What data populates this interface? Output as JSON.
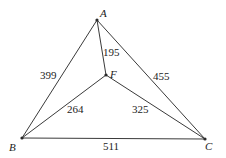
{
  "diagram": {
    "type": "weighted-graph",
    "vertices": [
      {
        "id": "A",
        "label": "A",
        "x": 97,
        "y": 20,
        "lx": 100,
        "ly": 17
      },
      {
        "id": "F",
        "label": "F",
        "x": 106,
        "y": 75,
        "lx": 110,
        "ly": 78
      },
      {
        "id": "B",
        "label": "B",
        "x": 22,
        "y": 138,
        "lx": 9,
        "ly": 151
      },
      {
        "id": "C",
        "label": "C",
        "x": 205,
        "y": 139,
        "lx": 205,
        "ly": 150
      }
    ],
    "edges": [
      {
        "from": "A",
        "to": "B",
        "weight": "399",
        "lx": 40,
        "ly": 79
      },
      {
        "from": "A",
        "to": "C",
        "weight": "455",
        "lx": 153,
        "ly": 80
      },
      {
        "from": "A",
        "to": "F",
        "weight": "195",
        "lx": 103,
        "ly": 56
      },
      {
        "from": "B",
        "to": "F",
        "weight": "264",
        "lx": 67,
        "ly": 113
      },
      {
        "from": "F",
        "to": "C",
        "weight": "325",
        "lx": 132,
        "ly": 113
      },
      {
        "from": "B",
        "to": "C",
        "weight": "511",
        "lx": 103,
        "ly": 150
      }
    ]
  }
}
